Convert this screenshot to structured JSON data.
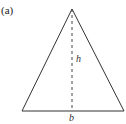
{
  "figure": {
    "panel_label": "(a)",
    "shape": "isosceles-triangle",
    "height_label": "h",
    "base_label": "b",
    "stroke_color": "#333333",
    "geometry": {
      "apex": [
        72,
        9
      ],
      "base_left": [
        22,
        111
      ],
      "base_right": [
        124,
        111
      ],
      "height_line": {
        "from": [
          72,
          9
        ],
        "to": [
          72,
          111
        ],
        "style": "dashed"
      }
    }
  }
}
